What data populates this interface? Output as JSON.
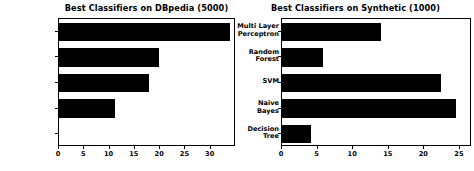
{
  "figure": {
    "width": 474,
    "height": 171,
    "background": "#ffffff",
    "bar_color": "#000000",
    "axis_color": "#000000"
  },
  "chart_data": [
    {
      "type": "bar",
      "orientation": "horizontal",
      "title": "Best Classifiers on DBpedia (5000)",
      "xlabel": "",
      "ylabel": "",
      "categories": [
        "Multi Layer\nPerceptron",
        "Random\nForest",
        "SVM",
        "Naïve\nBayes",
        "Decision\nTree"
      ],
      "category_lines": [
        [
          "Multi Layer",
          "Perceptron"
        ],
        [
          "Random",
          "Forest"
        ],
        [
          "SVM"
        ],
        [
          "Naïve",
          "Bayes"
        ],
        [
          "Decision",
          "Tree"
        ]
      ],
      "values": [
        33.8,
        19.8,
        17.8,
        11.0,
        0.0
      ],
      "xticks": [
        0,
        5,
        10,
        15,
        20,
        25,
        30
      ],
      "xtick_labels": [
        "0",
        "5",
        "10",
        "15",
        "20",
        "25",
        "30"
      ],
      "xlim": [
        0,
        35
      ],
      "grid": false,
      "legend": null
    },
    {
      "type": "bar",
      "orientation": "horizontal",
      "title": "Best Classifiers on Synthetic (1000)",
      "xlabel": "",
      "ylabel": "",
      "categories": [
        "Multi Layer\nPerceptron",
        "Random\nForest",
        "SVM",
        "Naïve\nBayes",
        "Decision\nTree"
      ],
      "category_lines": [
        [
          "Multi Layer",
          "Perceptron"
        ],
        [
          "Random",
          "Forest"
        ],
        [
          "SVM"
        ],
        [
          "Naïve",
          "Bayes"
        ],
        [
          "Decision",
          "Tree"
        ]
      ],
      "values": [
        13.9,
        5.8,
        22.3,
        24.5,
        4.1
      ],
      "xticks": [
        0,
        5,
        10,
        15,
        20,
        25
      ],
      "xtick_labels": [
        "0",
        "5",
        "10",
        "15",
        "20",
        "25"
      ],
      "xlim": [
        0,
        26.7
      ],
      "grid": false,
      "legend": null
    }
  ]
}
